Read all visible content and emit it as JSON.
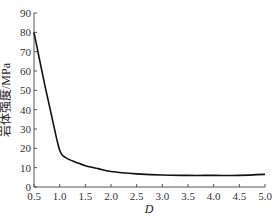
{
  "chart_data": {
    "type": "line",
    "title": "",
    "xlabel": "D",
    "ylabel": "岩体强度/MPa",
    "xlim": [
      0.5,
      5.0
    ],
    "ylim": [
      0,
      90
    ],
    "xticks": [
      "0.5",
      "1.0",
      "1.5",
      "2.0",
      "2.5",
      "3.0",
      "3.5",
      "4.0",
      "4.5",
      "5.0"
    ],
    "yticks": [
      "0",
      "10",
      "20",
      "30",
      "40",
      "50",
      "60",
      "70",
      "80",
      "90"
    ],
    "grid": false,
    "legend": null,
    "series": [
      {
        "name": "岩体强度",
        "color": "#111111",
        "x": [
          0.5,
          0.6,
          0.7,
          0.8,
          0.9,
          0.95,
          1.0,
          1.05,
          1.1,
          1.2,
          1.3,
          1.5,
          1.75,
          2.0,
          2.5,
          3.0,
          3.5,
          4.0,
          4.5,
          5.0
        ],
        "y": [
          80,
          67,
          54,
          42,
          30,
          24,
          19,
          16.5,
          15.5,
          14,
          13,
          11,
          9.5,
          8,
          6.8,
          6.2,
          6.0,
          6.0,
          6.0,
          6.5
        ]
      }
    ]
  }
}
